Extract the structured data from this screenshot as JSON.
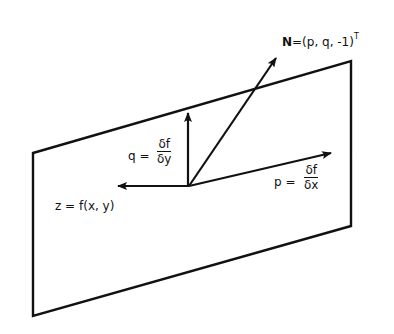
{
  "diagram": {
    "plane": {
      "corners": [
        [
          33,
          153
        ],
        [
          351,
          61
        ],
        [
          351,
          226
        ],
        [
          33,
          316
        ]
      ],
      "stroke": "#111111"
    },
    "origin": [
      189,
      186
    ],
    "vectors": {
      "normal": {
        "tip": [
          276,
          58
        ],
        "label_symbol": "N",
        "label_rest": "=(p, q, -1)",
        "label_sup": "T"
      },
      "q": {
        "tip": [
          188,
          113
        ],
        "label_prefix": "q =",
        "numerator": "δf",
        "denominator": "δy"
      },
      "p": {
        "tip": [
          331,
          153
        ],
        "label_prefix": "p =",
        "numerator": "δf",
        "denominator": "δx"
      },
      "z": {
        "tip": [
          118,
          186
        ],
        "label": "z = f(x, y)"
      }
    }
  }
}
